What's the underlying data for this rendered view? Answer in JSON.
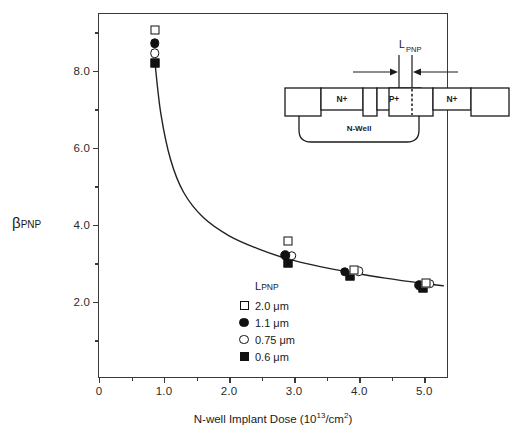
{
  "chart_data": {
    "type": "scatter",
    "title": "",
    "xlabel": "N-well Implant Dose (10^13/cm^2)",
    "ylabel": "βPNP",
    "xlim": [
      0,
      5.38
    ],
    "ylim": [
      0.0,
      9.48
    ],
    "grid": false,
    "legend_position": "inner-lower-left",
    "legend_title": "LPNP",
    "x_ticks_major": [
      0,
      1.0,
      2.0,
      3.0,
      4.0,
      5.0
    ],
    "x_tick_labels": [
      "0",
      "1.0",
      "2.0",
      "3.0",
      "4.0",
      "5.0"
    ],
    "x_ticks_minor": [
      0.5,
      1.5,
      2.5,
      3.5,
      4.5
    ],
    "y_ticks_major": [
      2.0,
      4.0,
      6.0,
      8.0
    ],
    "y_tick_labels": [
      "2.0",
      "4.0",
      "6.0",
      "8.0"
    ],
    "y_ticks_minor": [
      1.0,
      3.0,
      5.0,
      7.0,
      9.0
    ],
    "series": [
      {
        "name": "2.0 μm",
        "marker": "open-square",
        "points": [
          {
            "x": 0.86,
            "y": 9.06
          },
          {
            "x": 2.9,
            "y": 3.58
          },
          {
            "x": 3.92,
            "y": 2.82
          },
          {
            "x": 5.02,
            "y": 2.5
          }
        ]
      },
      {
        "name": "1.1 μm",
        "marker": "filled-circle",
        "points": [
          {
            "x": 0.86,
            "y": 8.72
          },
          {
            "x": 2.86,
            "y": 3.22
          },
          {
            "x": 3.78,
            "y": 2.78
          },
          {
            "x": 4.92,
            "y": 2.44
          }
        ]
      },
      {
        "name": "0.75 μm",
        "marker": "open-circle",
        "points": [
          {
            "x": 0.86,
            "y": 8.46
          },
          {
            "x": 2.96,
            "y": 3.2
          },
          {
            "x": 3.99,
            "y": 2.8
          },
          {
            "x": 5.08,
            "y": 2.48
          }
        ]
      },
      {
        "name": "0.6 μm",
        "marker": "filled-square",
        "points": [
          {
            "x": 0.86,
            "y": 8.22
          },
          {
            "x": 2.9,
            "y": 3.02
          },
          {
            "x": 3.86,
            "y": 2.68
          },
          {
            "x": 4.98,
            "y": 2.36
          }
        ]
      }
    ],
    "fit_curve": {
      "description": "monotonically decreasing fit through all L_PNP groups",
      "points": [
        {
          "x": 0.86,
          "y": 8.22
        },
        {
          "x": 0.95,
          "y": 6.9
        },
        {
          "x": 1.1,
          "y": 5.7
        },
        {
          "x": 1.3,
          "y": 4.85
        },
        {
          "x": 1.6,
          "y": 4.2
        },
        {
          "x": 2.0,
          "y": 3.72
        },
        {
          "x": 2.45,
          "y": 3.38
        },
        {
          "x": 2.9,
          "y": 3.12
        },
        {
          "x": 3.4,
          "y": 2.92
        },
        {
          "x": 3.9,
          "y": 2.76
        },
        {
          "x": 4.4,
          "y": 2.62
        },
        {
          "x": 5.0,
          "y": 2.48
        },
        {
          "x": 5.3,
          "y": 2.42
        }
      ]
    }
  },
  "axes": {
    "y_title_main": "β",
    "y_title_sub": "PNP",
    "x_title_pre": "N-well Implant Dose (10",
    "x_title_sup1": "13",
    "x_title_mid": "/cm",
    "x_title_sup2": "2",
    "x_title_post": ")"
  },
  "legend": {
    "title_main": "L",
    "title_sub": "PNP",
    "items": [
      {
        "label": "2.0 μm",
        "marker": "open-square"
      },
      {
        "label": "1.1 μm",
        "marker": "filled-circle"
      },
      {
        "label": "0.75 μm",
        "marker": "open-circle"
      },
      {
        "label": "0.6 μm",
        "marker": "filled-square"
      }
    ]
  },
  "inset": {
    "dimension_label_main": "L",
    "dimension_label_sub": "PNP",
    "regions": [
      {
        "label": "",
        "name": "left-contact-box"
      },
      {
        "label": "N+",
        "name": "n-plus-left-box"
      },
      {
        "label": "",
        "name": "field-oxide-box"
      },
      {
        "label": "P+",
        "name": "p-plus-box"
      },
      {
        "label": "",
        "name": "base-gap-box"
      },
      {
        "label": "N+",
        "name": "n-plus-right-box"
      },
      {
        "label": "",
        "name": "right-contact-box"
      }
    ],
    "well_label": "N-Well"
  },
  "colors": {
    "ink": "#111111",
    "axis": "#3a3a3a",
    "background": "#ffffff"
  }
}
